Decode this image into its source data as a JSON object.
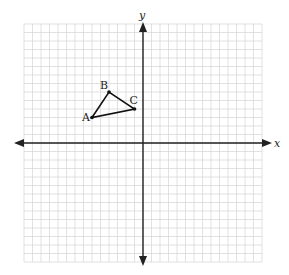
{
  "diagram": {
    "type": "coordinate-grid",
    "axes": {
      "x_label": "x",
      "y_label": "y"
    },
    "grid": {
      "min": -14,
      "max": 14,
      "unit_px": 8.5,
      "origin_px": [
        143,
        143
      ]
    },
    "triangle": {
      "points": [
        {
          "name": "A",
          "x": -6,
          "y": 3
        },
        {
          "name": "B",
          "x": -4,
          "y": 6
        },
        {
          "name": "C",
          "x": -1,
          "y": 4
        }
      ]
    },
    "colors": {
      "grid": "#d4d4d4",
      "axis": "#222222",
      "shape": "#111111"
    }
  }
}
